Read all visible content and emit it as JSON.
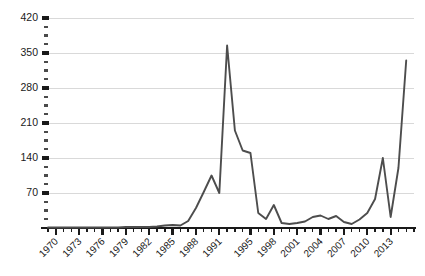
{
  "chart_data": {
    "type": "line",
    "title": "",
    "subtitle": "",
    "xlabel": "",
    "ylabel": "",
    "grid": "horizontal",
    "legend": "none",
    "line_color": "#4d4d4d",
    "grid_color": "#c9c9c9",
    "axis_color": "#1a1a1a",
    "background_color": "#ffffff",
    "xlim": [
      1969,
      2016
    ],
    "ylim": [
      0,
      420
    ],
    "y_ticks": [
      70,
      140,
      210,
      280,
      350,
      420
    ],
    "y_tick_labels": [
      "70",
      "140",
      "210",
      "280",
      "350",
      "420"
    ],
    "y_minor_interval": 17.5,
    "x_tick_labels": [
      "1970",
      "1973",
      "1976",
      "1979",
      "1982",
      "1985",
      "1988",
      "1991",
      "1995",
      "1998",
      "2001",
      "2004",
      "2007",
      "2010",
      "2013"
    ],
    "x_tick_values": [
      1970,
      1973,
      1976,
      1979,
      1982,
      1985,
      1988,
      1991,
      1995,
      1998,
      2001,
      2004,
      2007,
      2010,
      2013
    ],
    "x_label_rotation": -45,
    "x_minor_every": 1,
    "x": [
      1969,
      1970,
      1971,
      1972,
      1973,
      1974,
      1975,
      1976,
      1977,
      1978,
      1979,
      1980,
      1981,
      1982,
      1983,
      1984,
      1985,
      1986,
      1987,
      1988,
      1989,
      1990,
      1991,
      1992,
      1993,
      1994,
      1995,
      1996,
      1997,
      1998,
      1999,
      2000,
      2001,
      2002,
      2003,
      2004,
      2005,
      2006,
      2007,
      2008,
      2009,
      2010,
      2011,
      2012,
      2013,
      2014,
      2015
    ],
    "y": [
      1,
      1,
      1,
      1,
      1,
      1,
      1,
      1,
      1,
      1,
      2,
      2,
      2,
      2,
      3,
      5,
      6,
      5,
      14,
      40,
      72,
      105,
      70,
      365,
      195,
      155,
      150,
      30,
      18,
      46,
      10,
      8,
      10,
      13,
      22,
      25,
      18,
      24,
      12,
      8,
      17,
      30,
      58,
      140,
      22,
      120,
      335
    ],
    "series": [
      {
        "name": "value",
        "values": [
          1,
          1,
          1,
          1,
          1,
          1,
          1,
          1,
          1,
          1,
          2,
          2,
          2,
          2,
          3,
          5,
          6,
          5,
          14,
          40,
          72,
          105,
          70,
          365,
          195,
          155,
          150,
          30,
          18,
          46,
          10,
          8,
          10,
          13,
          22,
          25,
          18,
          24,
          12,
          8,
          17,
          30,
          58,
          140,
          22,
          120,
          335
        ]
      }
    ],
    "annotations": [],
    "peak": {
      "x": 1992,
      "y": 365
    },
    "final_point": {
      "x": 2015,
      "y": 335
    }
  },
  "layout": {
    "plot_left": 48,
    "plot_right": 414,
    "plot_top": 18,
    "plot_bottom": 228
  }
}
